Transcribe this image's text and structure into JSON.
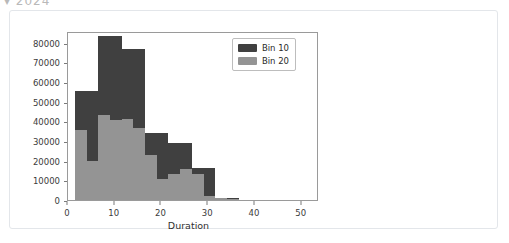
{
  "clipped_heading": "▾ 2024",
  "card": {
    "background": "#ffffff",
    "border_color": "#e3e6ea"
  },
  "chart_data": {
    "type": "bar",
    "subtype": "histogram-overlay",
    "title": "",
    "xlabel": "Duration",
    "ylabel": "Flights",
    "xlim": [
      0,
      52
    ],
    "ylim": [
      0,
      86000
    ],
    "xticks": [
      0,
      10,
      20,
      30,
      40,
      50
    ],
    "xtick_labels": [
      "0",
      "10",
      "20",
      "30",
      "40",
      "50"
    ],
    "yticks": [
      0,
      10000,
      20000,
      30000,
      40000,
      50000,
      60000,
      70000,
      80000
    ],
    "ytick_labels": [
      "0",
      "10000",
      "20000",
      "30000",
      "40000",
      "50000",
      "60000",
      "70000",
      "80000"
    ],
    "grid": false,
    "legend_position": "upper right",
    "series": [
      {
        "name": "Bin 10",
        "color": "#404040",
        "bin_width": 5,
        "bin_edges": [
          1.5,
          6.5,
          11.5,
          16.5,
          21.5,
          26.5,
          31.5,
          36.5
        ],
        "values": [
          55500,
          83500,
          77000,
          34000,
          29000,
          16500,
          1200
        ]
      },
      {
        "name": "Bin 20",
        "color": "#949494",
        "bin_width": 2.5,
        "bin_edges": [
          1.5,
          4.0,
          6.5,
          9.0,
          11.5,
          14.0,
          16.5,
          19.0,
          21.5,
          24.0,
          26.5,
          29.0,
          31.5,
          34.0,
          36.5
        ],
        "values": [
          35500,
          19800,
          43300,
          40800,
          41000,
          36500,
          23000,
          10800,
          13300,
          16000,
          13200,
          2200,
          900,
          300
        ]
      }
    ]
  },
  "legend": {
    "items": [
      {
        "label": "Bin 10",
        "color": "#404040"
      },
      {
        "label": "Bin 20",
        "color": "#949494"
      }
    ]
  }
}
